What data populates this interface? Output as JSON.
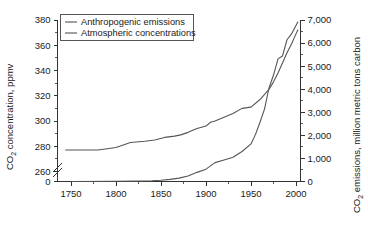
{
  "chart_data": {
    "type": "line",
    "title": "",
    "xlabel": "",
    "ylabel": "CO2 concentration, ppmv",
    "ylabel_right": "CO2 emissions, million metric tons carbon",
    "grid": false,
    "legend_position": "top-left",
    "xlim": [
      1735,
      2005
    ],
    "xticks": [
      1750,
      1800,
      1850,
      1900,
      1950,
      2000
    ],
    "xticklabels": [
      "1750",
      "1800",
      "1850",
      "1900",
      "1950",
      "2000"
    ],
    "xminor_step": 25,
    "ylim_left": [
      260,
      380
    ],
    "yticks_left": [
      260,
      280,
      300,
      320,
      340,
      360,
      380
    ],
    "yticklabels_left": [
      "260",
      "280",
      "300",
      "320",
      "340",
      "360",
      "380"
    ],
    "y_left_broken_zero_label": "0",
    "y_left_axis_break": true,
    "ylim_right": [
      0,
      7000
    ],
    "yticks_right": [
      0,
      1000,
      2000,
      3000,
      4000,
      5000,
      6000,
      7000
    ],
    "yticklabels_right": [
      "0",
      "1,000",
      "2,000",
      "3,000",
      "4,000",
      "5,000",
      "6,000",
      "7,000"
    ],
    "series": [
      {
        "name": "Anthropogenic emissions",
        "axis": "right",
        "color": "#555555",
        "x": [
          1751,
          1800,
          1820,
          1840,
          1850,
          1860,
          1870,
          1880,
          1890,
          1900,
          1910,
          1920,
          1930,
          1940,
          1950,
          1955,
          1960,
          1965,
          1970,
          1975,
          1980,
          1985,
          1990,
          1995,
          2000,
          2002
        ],
        "values": [
          3,
          8,
          17,
          33,
          54,
          91,
          147,
          236,
          396,
          534,
          819,
          932,
          1053,
          1299,
          1630,
          2043,
          2569,
          3137,
          4053,
          4615,
          5315,
          5441,
          6143,
          6396,
          6765,
          6915
        ]
      },
      {
        "name": "Atmospheric concentrations",
        "axis": "left",
        "color": "#555555",
        "x": [
          1744,
          1760,
          1780,
          1800,
          1816,
          1832,
          1843,
          1854,
          1865,
          1872,
          1880,
          1890,
          1900,
          1905,
          1910,
          1920,
          1930,
          1940,
          1950,
          1960,
          1970,
          1975,
          1980,
          1985,
          1990,
          1995,
          2000,
          2002
        ],
        "values": [
          277,
          277,
          277,
          279,
          283,
          284,
          285,
          287,
          288,
          289,
          291,
          294,
          296,
          299,
          300,
          303,
          306,
          310,
          311,
          317,
          325,
          331,
          338,
          346,
          354,
          361,
          369,
          372
        ]
      }
    ],
    "annotations": []
  },
  "legend": {
    "items": [
      {
        "label": "Anthropogenic emissions"
      },
      {
        "label": "Atmospheric concentrations"
      }
    ]
  },
  "axes": {
    "left_title_main": "CO",
    "left_title_sub": "2",
    "left_title_rest": " concentration, ppmv",
    "right_title_main": "CO",
    "right_title_sub": "2",
    "right_title_rest": " emissions, million metric tons carbon"
  },
  "colors": {
    "background": "#ffffff",
    "axis": "#333333",
    "series": "#555555"
  }
}
